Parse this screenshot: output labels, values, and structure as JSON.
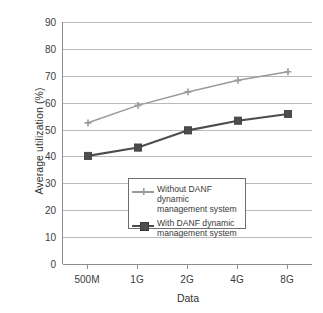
{
  "chart_data": {
    "type": "line",
    "title": "",
    "xlabel": "Data",
    "ylabel": "Average utilization (%)",
    "categories": [
      "500M",
      "1G",
      "2G",
      "4G",
      "8G"
    ],
    "ylim": [
      0,
      90
    ],
    "yticks": [
      "0",
      "10",
      "20",
      "30",
      "40",
      "50",
      "60",
      "70",
      "80",
      "90"
    ],
    "ytick_values": [
      0,
      10,
      20,
      30,
      40,
      50,
      60,
      70,
      80,
      90
    ],
    "grid": true,
    "legend_position": "center",
    "series": [
      {
        "name": "Without DANF dynamic\nmanagement system",
        "values": [
          52.5,
          59,
          64,
          68.3,
          71.5
        ],
        "color": "#9a9a9a",
        "marker": "cross"
      },
      {
        "name": "With DANF dynamic\nmanagement system",
        "values": [
          40.2,
          43.3,
          49.7,
          53.3,
          55.8
        ],
        "color": "#4d4d4d",
        "marker": "square"
      }
    ]
  },
  "legend": {
    "items": [
      {
        "label": "Without DANF dynamic\nmanagement system"
      },
      {
        "label": "With DANF dynamic\nmanagement system"
      }
    ]
  },
  "axes": {
    "y_title": "Average utilization (%)",
    "x_title": "Data"
  }
}
